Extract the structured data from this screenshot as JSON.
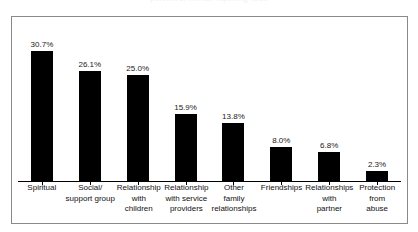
{
  "figure": {
    "title_remnant": "percent of women reporting need"
  },
  "chart_data": {
    "type": "bar",
    "title": "",
    "xlabel": "",
    "ylabel": "",
    "ylim": [
      0,
      36
    ],
    "grid": false,
    "legend": "none",
    "orientation": "vertical",
    "bar_color": "#000000",
    "categories": [
      "Spiritual",
      "Social/ support group",
      "Relationship with children",
      "Relationship with service providers",
      "Other family relationships",
      "Friendships",
      "Relationships with partner",
      "Protection from abuse"
    ],
    "category_lines": [
      [
        "Spiritual"
      ],
      [
        "Social/",
        "support group"
      ],
      [
        "Relationship",
        "with",
        "children"
      ],
      [
        "Relationship",
        "with service",
        "providers"
      ],
      [
        "Other",
        "family",
        "relationships"
      ],
      [
        "Friendships"
      ],
      [
        "Relationships",
        "with",
        "partner"
      ],
      [
        "Protection",
        "from",
        "abuse"
      ]
    ],
    "values": [
      30.7,
      26.1,
      25.0,
      15.9,
      13.8,
      8.0,
      6.8,
      2.3
    ],
    "value_labels": [
      "30.7%",
      "26.1%",
      "25.0%",
      "15.9%",
      "13.8%",
      "8.0%",
      "6.8%",
      "2.3%"
    ]
  }
}
